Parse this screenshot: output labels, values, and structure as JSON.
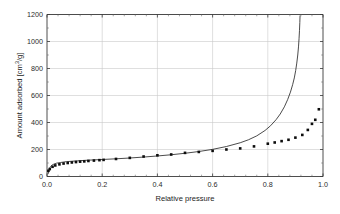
{
  "chart_data": {
    "type": "scatter",
    "title": "",
    "xlabel": "Relative pressure",
    "ylabel": "Amount adsorbed [cm3/g]",
    "ylabel_base": "Amount adsorbed [cm",
    "ylabel_sup": "3",
    "ylabel_tail": "/g]",
    "xlim": [
      0.0,
      1.0
    ],
    "ylim": [
      0,
      1200
    ],
    "xticks": [
      0.0,
      0.2,
      0.4,
      0.6,
      0.8,
      1.0
    ],
    "xtick_labels": [
      "0.0",
      "0.2",
      "0.4",
      "0.6",
      "0.8",
      "1.0"
    ],
    "yticks": [
      0,
      200,
      400,
      600,
      800,
      1000,
      1200
    ],
    "ytick_labels": [
      "0",
      "200",
      "400",
      "600",
      "800",
      "1000",
      "1200"
    ],
    "grid": true,
    "grid_color": "#c9c9c9",
    "legend": null,
    "series": [
      {
        "name": "measured isotherm",
        "style": "markers",
        "marker": "square",
        "color": "#0d0d0d",
        "points": [
          [
            0.005,
            42
          ],
          [
            0.01,
            55
          ],
          [
            0.02,
            72
          ],
          [
            0.03,
            82
          ],
          [
            0.045,
            90
          ],
          [
            0.06,
            96
          ],
          [
            0.075,
            100
          ],
          [
            0.09,
            104
          ],
          [
            0.105,
            107
          ],
          [
            0.12,
            110
          ],
          [
            0.135,
            112
          ],
          [
            0.15,
            115
          ],
          [
            0.17,
            118
          ],
          [
            0.19,
            121
          ],
          [
            0.205,
            123
          ],
          [
            0.25,
            130
          ],
          [
            0.3,
            138
          ],
          [
            0.35,
            148
          ],
          [
            0.4,
            157
          ],
          [
            0.45,
            163
          ],
          [
            0.5,
            175
          ],
          [
            0.55,
            182
          ],
          [
            0.6,
            190
          ],
          [
            0.65,
            200
          ],
          [
            0.7,
            208
          ],
          [
            0.75,
            223
          ],
          [
            0.8,
            243
          ],
          [
            0.825,
            252
          ],
          [
            0.85,
            262
          ],
          [
            0.875,
            272
          ],
          [
            0.9,
            288
          ],
          [
            0.925,
            308
          ],
          [
            0.945,
            345
          ],
          [
            0.96,
            390
          ],
          [
            0.972,
            420
          ],
          [
            0.985,
            498
          ]
        ]
      },
      {
        "name": "model curve",
        "style": "line",
        "color": "#2b2b2b",
        "points": [
          [
            0.004,
            20
          ],
          [
            0.008,
            55
          ],
          [
            0.012,
            72
          ],
          [
            0.018,
            84
          ],
          [
            0.025,
            92
          ],
          [
            0.035,
            99
          ],
          [
            0.05,
            104
          ],
          [
            0.07,
            110
          ],
          [
            0.09,
            113
          ],
          [
            0.11,
            116
          ],
          [
            0.14,
            120
          ],
          [
            0.17,
            123
          ],
          [
            0.2,
            126
          ],
          [
            0.25,
            131
          ],
          [
            0.3,
            137
          ],
          [
            0.35,
            144
          ],
          [
            0.4,
            152
          ],
          [
            0.45,
            161
          ],
          [
            0.5,
            172
          ],
          [
            0.55,
            185
          ],
          [
            0.6,
            201
          ],
          [
            0.65,
            222
          ],
          [
            0.7,
            250
          ],
          [
            0.73,
            272
          ],
          [
            0.76,
            301
          ],
          [
            0.79,
            341
          ],
          [
            0.81,
            376
          ],
          [
            0.83,
            421
          ],
          [
            0.845,
            463
          ],
          [
            0.86,
            516
          ],
          [
            0.872,
            570
          ],
          [
            0.882,
            625
          ],
          [
            0.89,
            680
          ],
          [
            0.896,
            730
          ],
          [
            0.901,
            785
          ],
          [
            0.905,
            840
          ],
          [
            0.9085,
            900
          ],
          [
            0.9112,
            960
          ],
          [
            0.9132,
            1020
          ],
          [
            0.9148,
            1080
          ],
          [
            0.916,
            1140
          ],
          [
            0.9168,
            1190
          ]
        ]
      }
    ]
  }
}
